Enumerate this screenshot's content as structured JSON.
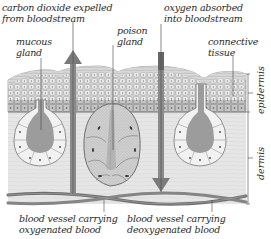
{
  "diagram": {
    "labels": {
      "co2": [
        "carbon dioxide expelled",
        "from bloodstream"
      ],
      "oxygen": [
        "oxygen absorbed",
        "into bloodstream"
      ],
      "mucous_gland": [
        "mucous",
        "gland"
      ],
      "poison_gland": [
        "poison",
        "gland"
      ],
      "connective_tissue": [
        "connective",
        "tissue"
      ],
      "epidermis": "epidermis",
      "dermis": "dermis",
      "vessel_oxygenated": [
        "blood vessel carrying",
        "oxygenated blood"
      ],
      "vessel_deoxygenated": [
        "blood vessel carrying",
        "deoxygenated blood"
      ]
    },
    "colors": {
      "epidermis": "#c9c9c9",
      "dermis": "#e4e4e4",
      "gland_lumen": "#9a9a9a",
      "arrow": "#8a8a8a",
      "vessel": "#7a7a7a",
      "line": "#444444"
    }
  }
}
